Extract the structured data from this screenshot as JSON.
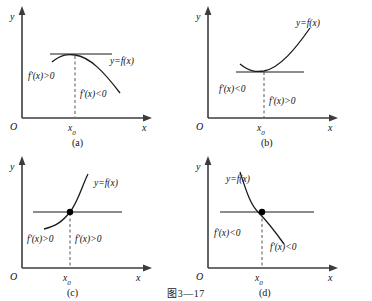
{
  "figure": {
    "caption": "图3—17",
    "background_color": "#ffffff",
    "axis_color": "#3c3c3c",
    "curve_color": "#1a1a1a",
    "dash_color": "#555555"
  },
  "chart_data": {
    "type": "line",
    "title": "图3—17",
    "panels": [
      {
        "id": "a",
        "caption": "(a)",
        "curve_label": "y=f(x)",
        "xaxis_label": "x",
        "yaxis_label": "y",
        "origin_label": "O",
        "critical_point_label": "x0",
        "left_sign_label": "f'(x)>0",
        "right_sign_label": "f'(x)<0",
        "shape": "concave-down maximum",
        "tangent": "horizontal",
        "has_point_marker": false
      },
      {
        "id": "b",
        "caption": "(b)",
        "curve_label": "y=f(x)",
        "xaxis_label": "x",
        "yaxis_label": "y",
        "origin_label": "O",
        "critical_point_label": "x0",
        "left_sign_label": "f'(x)<0",
        "right_sign_label": "f'(x)>0",
        "shape": "concave-up minimum",
        "tangent": "horizontal",
        "has_point_marker": false
      },
      {
        "id": "c",
        "caption": "(c)",
        "curve_label": "y=f(x)",
        "xaxis_label": "x",
        "yaxis_label": "y",
        "origin_label": "O",
        "critical_point_label": "x0",
        "left_sign_label": "f'(x)>0",
        "right_sign_label": "f'(x)>0",
        "shape": "increasing inflection",
        "tangent": "horizontal",
        "has_point_marker": true
      },
      {
        "id": "d",
        "caption": "(d)",
        "curve_label": "y=f(x)",
        "xaxis_label": "x",
        "yaxis_label": "y",
        "origin_label": "O",
        "critical_point_label": "x0",
        "left_sign_label": "f'(x)<0",
        "right_sign_label": "f'(x)<0",
        "shape": "decreasing inflection",
        "tangent": "horizontal",
        "has_point_marker": true
      }
    ]
  }
}
